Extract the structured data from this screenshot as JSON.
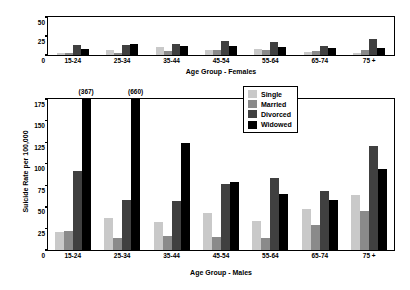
{
  "chart_data": [
    {
      "type": "bar",
      "title": "",
      "xlabel": "Age Group - Females",
      "ylabel": "",
      "ylim": [
        0,
        50
      ],
      "yticks": [
        0,
        25,
        50
      ],
      "grid": false,
      "legend_position": "none",
      "categories": [
        "15-24",
        "25-34",
        "35-44",
        "45-54",
        "55-64",
        "65-74",
        "75 +"
      ],
      "series": [
        {
          "name": "Single",
          "color": "#c9c9c9",
          "values": [
            3,
            7,
            10,
            6,
            8,
            4,
            3
          ]
        },
        {
          "name": "Married",
          "color": "#8a8a8a",
          "values": [
            3,
            3,
            5,
            7,
            6,
            5,
            6
          ]
        },
        {
          "name": "Divorced",
          "color": "#404040",
          "values": [
            13,
            13,
            14,
            19,
            17,
            12,
            21
          ]
        },
        {
          "name": "Widowed",
          "color": "#000000",
          "values": [
            8,
            15,
            12,
            12,
            10,
            9,
            9
          ]
        }
      ]
    },
    {
      "type": "bar",
      "title": "",
      "xlabel": "Age Group - Males",
      "ylabel": "Suicide Rate per 100,000",
      "ylim": [
        0,
        175
      ],
      "yticks": [
        0,
        25,
        50,
        75,
        100,
        125,
        150,
        175
      ],
      "grid": false,
      "legend_position": "top-right",
      "categories": [
        "15-24",
        "25-34",
        "35-44",
        "45-54",
        "55-64",
        "65-74",
        "75 +"
      ],
      "series": [
        {
          "name": "Single",
          "color": "#c9c9c9",
          "values": [
            21,
            37,
            33,
            43,
            34,
            48,
            64
          ]
        },
        {
          "name": "Married",
          "color": "#8a8a8a",
          "values": [
            22,
            14,
            16,
            15,
            14,
            29,
            45
          ]
        },
        {
          "name": "Divorced",
          "color": "#404040",
          "values": [
            91,
            58,
            57,
            76,
            84,
            68,
            121
          ]
        },
        {
          "name": "Widowed",
          "color": "#000000",
          "values": [
            367,
            660,
            124,
            79,
            65,
            58,
            94
          ]
        }
      ],
      "annotations": [
        {
          "category": "15-24",
          "series": "Widowed",
          "text": "(367)"
        },
        {
          "category": "25-34",
          "series": "Widowed",
          "text": "(660)"
        }
      ]
    }
  ],
  "legend": {
    "items": [
      {
        "label": "Single",
        "color": "#c9c9c9"
      },
      {
        "label": "Married",
        "color": "#8a8a8a"
      },
      {
        "label": "Divorced",
        "color": "#404040"
      },
      {
        "label": "Widowed",
        "color": "#000000"
      }
    ]
  }
}
